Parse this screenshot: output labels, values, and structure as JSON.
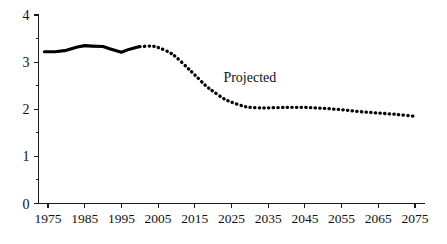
{
  "chart_data": {
    "type": "line",
    "title": "",
    "subtitle": "",
    "xlabel": "",
    "ylabel": "",
    "xlim": [
      1974,
      2075
    ],
    "ylim": [
      0,
      4
    ],
    "grid": false,
    "legend": "none",
    "y_ticks": [
      0,
      1,
      2,
      3,
      4
    ],
    "y_tick_labels": [
      "0",
      "1",
      "2",
      "3",
      "4"
    ],
    "y_minor_ticks": [
      0.5,
      1.5,
      2.5,
      3.5
    ],
    "x_ticks": [
      1975,
      1985,
      1995,
      2005,
      2015,
      2025,
      2035,
      2045,
      2055,
      2065,
      2075
    ],
    "x_tick_labels": [
      "1975",
      "1985",
      "1995",
      "2005",
      "2015",
      "2025",
      "2035",
      "2045",
      "2055",
      "2065",
      "2075"
    ],
    "annotations": [
      {
        "text": "Projected",
        "x": 2030,
        "y": 2.58
      }
    ],
    "series": [
      {
        "name": "Historical",
        "style": "solid",
        "color": "#000000",
        "x": [
          1974,
          1977,
          1980,
          1983,
          1985,
          1987,
          1990,
          1992,
          1995,
          1997,
          2000
        ],
        "values": [
          3.22,
          3.22,
          3.25,
          3.32,
          3.35,
          3.34,
          3.33,
          3.28,
          3.21,
          3.27,
          3.33
        ]
      },
      {
        "name": "Projected",
        "style": "dotted",
        "color": "#000000",
        "x": [
          2000,
          2003,
          2005,
          2008,
          2010,
          2013,
          2015,
          2018,
          2020,
          2023,
          2025,
          2028,
          2030,
          2033,
          2035,
          2040,
          2045,
          2050,
          2055,
          2060,
          2065,
          2070,
          2075
        ],
        "values": [
          3.33,
          3.34,
          3.31,
          3.21,
          3.1,
          2.88,
          2.73,
          2.5,
          2.38,
          2.22,
          2.15,
          2.07,
          2.04,
          2.03,
          2.03,
          2.04,
          2.04,
          2.02,
          1.99,
          1.95,
          1.92,
          1.89,
          1.85
        ]
      }
    ]
  }
}
